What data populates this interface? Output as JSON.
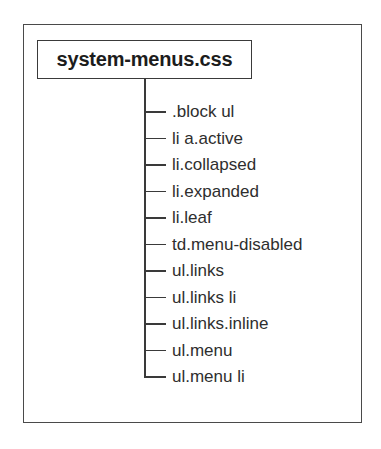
{
  "diagram": {
    "root": {
      "label": "system-menus.css"
    },
    "children": [
      {
        "label": ".block ul"
      },
      {
        "label": "li a.active"
      },
      {
        "label": "li.collapsed"
      },
      {
        "label": "li.expanded"
      },
      {
        "label": "li.leaf"
      },
      {
        "label": "td.menu-disabled"
      },
      {
        "label": "ul.links"
      },
      {
        "label": "ul.links li"
      },
      {
        "label": "ul.links.inline"
      },
      {
        "label": "ul.menu"
      },
      {
        "label": "ul.menu li"
      }
    ],
    "colors": {
      "line": "#3a3a3a",
      "text": "#2e2e2e",
      "background": "#ffffff"
    }
  }
}
